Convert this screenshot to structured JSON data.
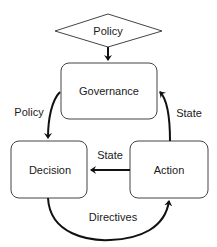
{
  "diagram": {
    "title_node": {
      "label": "Policy",
      "shape": "diamond"
    },
    "nodes": [
      {
        "id": "governance",
        "label": "Governance"
      },
      {
        "id": "decision",
        "label": "Decision"
      },
      {
        "id": "action",
        "label": "Action"
      }
    ],
    "edges": [
      {
        "from": "policy",
        "to": "governance",
        "label": ""
      },
      {
        "from": "governance",
        "to": "decision",
        "label": "Policy"
      },
      {
        "from": "action",
        "to": "governance",
        "label": "State"
      },
      {
        "from": "action",
        "to": "decision",
        "label": "State"
      },
      {
        "from": "decision",
        "to": "action",
        "label": "Directives"
      }
    ],
    "colors": {
      "stroke": "#1a1a1a",
      "box_border": "#333333",
      "background": "#ffffff"
    }
  }
}
